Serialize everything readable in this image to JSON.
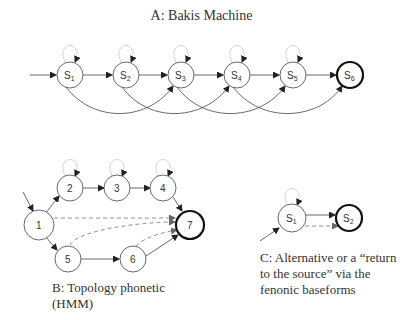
{
  "diagram_a": {
    "title": "A: Bakis Machine",
    "nodes": [
      {
        "id": "S1",
        "label": "S",
        "sub": "1",
        "x": 70,
        "y": 75,
        "final": false
      },
      {
        "id": "S2",
        "label": "S",
        "sub": "2",
        "x": 126,
        "y": 75,
        "final": false
      },
      {
        "id": "S3",
        "label": "S",
        "sub": "3",
        "x": 181,
        "y": 75,
        "final": false
      },
      {
        "id": "S4",
        "label": "S",
        "sub": "4",
        "x": 237,
        "y": 75,
        "final": false
      },
      {
        "id": "S5",
        "label": "S",
        "sub": "5",
        "x": 293,
        "y": 75,
        "final": false
      },
      {
        "id": "S6",
        "label": "S",
        "sub": "6",
        "x": 350,
        "y": 75,
        "final": true
      }
    ],
    "edges": [
      "start->S1",
      "S1->S2",
      "S2->S3",
      "S3->S4",
      "S4->S5",
      "S5->S6",
      "S1->S3",
      "S2->S4",
      "S3->S5",
      "S4->S6",
      "S1->S1",
      "S2->S2",
      "S3->S3",
      "S4->S4",
      "S5->S5"
    ]
  },
  "diagram_b": {
    "caption_line1": "B: Topology phonetic",
    "caption_line2": "(HMM)",
    "nodes": [
      {
        "id": "1",
        "label": "1",
        "x": 39,
        "y": 225
      },
      {
        "id": "2",
        "label": "2",
        "x": 70,
        "y": 188
      },
      {
        "id": "3",
        "label": "3",
        "x": 117,
        "y": 188
      },
      {
        "id": "4",
        "label": "4",
        "x": 163,
        "y": 188
      },
      {
        "id": "5",
        "label": "5",
        "x": 68,
        "y": 259
      },
      {
        "id": "6",
        "label": "6",
        "x": 133,
        "y": 259
      },
      {
        "id": "7",
        "label": "7",
        "x": 190,
        "y": 225,
        "final": true
      }
    ],
    "edges": [
      "start->1",
      "1->2",
      "2->3",
      "3->4",
      "4->7",
      "1->5",
      "5->6",
      "6->7",
      "1-->7 (dashed)",
      "5-->7 (dashed)",
      "6-->7 (dashed)",
      "2->2",
      "3->3",
      "4->4"
    ]
  },
  "diagram_c": {
    "caption_line1": "C: Alternative or a “return",
    "caption_line2": "to the source” via the",
    "caption_line3": "fenonic baseforms",
    "nodes": [
      {
        "id": "S1",
        "label": "S",
        "sub": "1",
        "x": 292,
        "y": 218
      },
      {
        "id": "S2",
        "label": "S",
        "sub": "2",
        "x": 349,
        "y": 218,
        "final": true
      }
    ],
    "edges": [
      "start->S1",
      "S1->S2",
      "S1-->S2 (dashed)",
      "S1->S1"
    ]
  }
}
